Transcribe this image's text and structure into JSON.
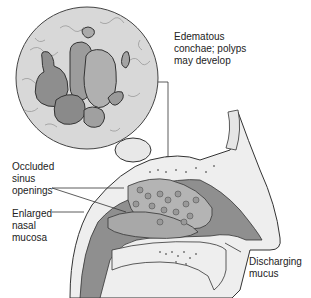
{
  "diagram": {
    "type": "anatomical-illustration",
    "labels": {
      "polyps": [
        "Edematous",
        "conchae; polyps",
        "may develop"
      ],
      "sinus": [
        "Occluded",
        "sinus",
        "openings"
      ],
      "mucosa": [
        "Enlarged",
        "nasal",
        "mucosa"
      ],
      "mucus": [
        "Discharging",
        "mucus"
      ]
    },
    "colors": {
      "tissue_dark": "#8a8a8a",
      "tissue_mid": "#a8a8a8",
      "tissue_light": "#d0d0d0",
      "bone": "#eeeeee",
      "outline": "#333333",
      "background": "#ffffff"
    }
  }
}
